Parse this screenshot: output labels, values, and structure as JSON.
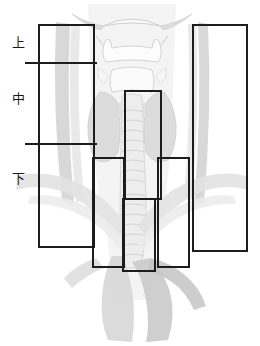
{
  "figure": {
    "title": "",
    "width": 260,
    "height": 346,
    "background_color": "#ffffff",
    "line_color": "#1c1c1c",
    "label_color": "#1a1a1a"
  },
  "zone_labels": [
    {
      "name": "upper-zone-label",
      "text": "上",
      "x": 12,
      "y": 36
    },
    {
      "name": "middle-zone-label",
      "text": "中",
      "x": 12,
      "y": 92
    },
    {
      "name": "lower-zone-label",
      "text": "下",
      "x": 12,
      "y": 172
    }
  ],
  "dividers": [
    {
      "name": "upper-middle-divider",
      "x": 25,
      "y": 62,
      "width": 72
    },
    {
      "name": "middle-lower-divider",
      "x": 25,
      "y": 143,
      "width": 72
    }
  ],
  "roi_boxes": [
    {
      "name": "left-lateral-roi",
      "x": 38,
      "y": 24,
      "width": 57,
      "height": 224
    },
    {
      "name": "right-lateral-roi",
      "x": 192,
      "y": 24,
      "width": 56,
      "height": 228
    },
    {
      "name": "central-upper-roi",
      "x": 124,
      "y": 90,
      "width": 38,
      "height": 110
    },
    {
      "name": "lower-left-roi",
      "x": 92,
      "y": 157,
      "width": 33,
      "height": 111
    },
    {
      "name": "lower-right-roi",
      "x": 157,
      "y": 157,
      "width": 33,
      "height": 111
    },
    {
      "name": "lower-central-roi",
      "x": 122,
      "y": 198,
      "width": 34,
      "height": 74
    }
  ],
  "anatomy": {
    "palette": {
      "outline": "#d8d8d8",
      "soft_tissue_light": "#e6e6e6",
      "soft_tissue_mid": "#d2d2d2",
      "soft_tissue_dark": "#bdbdbd",
      "vessel": "#cfcfcf",
      "cartilage_fill": "#fbfbfb"
    },
    "structures": [
      {
        "name": "hyoid-bone",
        "region": "upper"
      },
      {
        "name": "thyroid-cartilage",
        "region": "upper"
      },
      {
        "name": "cricoid-cartilage",
        "region": "middle"
      },
      {
        "name": "thyroid-gland-left-lobe",
        "region": "middle"
      },
      {
        "name": "thyroid-gland-right-lobe",
        "region": "middle"
      },
      {
        "name": "trachea",
        "region": "middle-lower"
      },
      {
        "name": "carotid-artery-left",
        "region": "lateral"
      },
      {
        "name": "carotid-artery-right",
        "region": "lateral"
      },
      {
        "name": "aortic-arch",
        "region": "lower"
      },
      {
        "name": "mediastinum",
        "region": "lower"
      }
    ]
  }
}
